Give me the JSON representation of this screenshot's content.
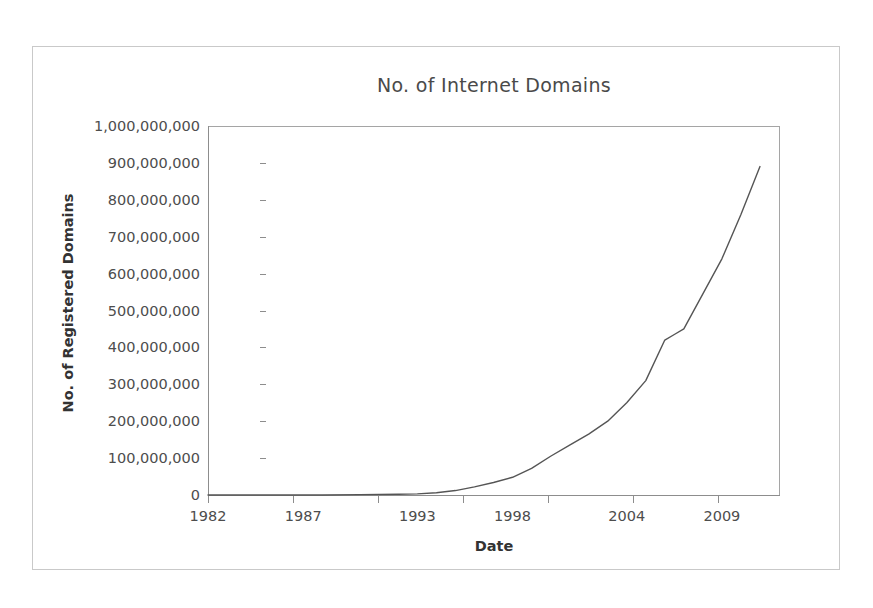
{
  "chart_data": {
    "type": "line",
    "title": "No. of Internet Domains",
    "xlabel": "Date",
    "ylabel": "No. of Registered Domains",
    "grid": false,
    "legend": "none",
    "xlim": [
      1982,
      2012
    ],
    "ylim": [
      0,
      1000000000
    ],
    "x_tick_labels": [
      "1982",
      "1987",
      "1993",
      "1998",
      "2004",
      "2009"
    ],
    "x_tick_values": [
      1982,
      1987,
      1993,
      1998,
      2004,
      2009
    ],
    "y_tick_labels": [
      "1,000,000,000",
      "900,000,000",
      "800,000,000",
      "700,000,000",
      "600,000,000",
      "500,000,000",
      "400,000,000",
      "300,000,000",
      "200,000,000",
      "100,000,000",
      "0"
    ],
    "y_tick_values": [
      1000000000,
      900000000,
      800000000,
      700000000,
      600000000,
      500000000,
      400000000,
      300000000,
      200000000,
      100000000,
      0
    ],
    "series": [
      {
        "name": "Registered Domains",
        "color": "#555555",
        "x": [
          1982,
          1985,
          1988,
          1990,
          1992,
          1993,
          1994,
          1995,
          1996,
          1997,
          1998,
          1999,
          2000,
          2001,
          2002,
          2003,
          2004,
          2005,
          2006,
          2006.5,
          2007,
          2008,
          2009,
          2010,
          2011
        ],
        "values": [
          0,
          0,
          0,
          1000000,
          2000000,
          3000000,
          6000000,
          12000000,
          22000000,
          34000000,
          48000000,
          72000000,
          105000000,
          135000000,
          165000000,
          200000000,
          250000000,
          310000000,
          420000000,
          435000000,
          450000000,
          545000000,
          640000000,
          760000000,
          890000000
        ]
      }
    ]
  }
}
